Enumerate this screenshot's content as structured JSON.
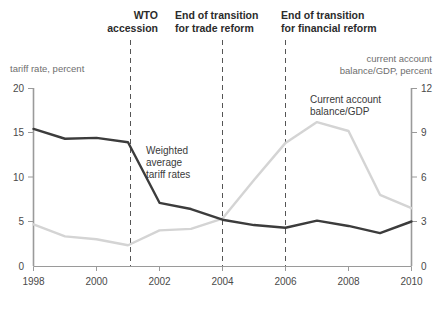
{
  "chart_data": {
    "type": "line",
    "title": "",
    "xlabel": "",
    "x": [
      1998,
      1999,
      2000,
      2001,
      2002,
      2003,
      2004,
      2005,
      2006,
      2007,
      2008,
      2009,
      2010
    ],
    "xtick_labels": [
      "1998",
      "2000",
      "2002",
      "2004",
      "2006",
      "2008",
      "2010"
    ],
    "xtick_values": [
      1998,
      2000,
      2002,
      2004,
      2006,
      2008,
      2010
    ],
    "xlim": [
      1998,
      2010
    ],
    "grid": false,
    "legend_position": "inline-annotations",
    "axes": [
      {
        "id": "left",
        "name": "tariff rate, percent",
        "ylim": [
          0,
          20
        ],
        "ticks": [
          0,
          5,
          10,
          15,
          20
        ],
        "tick_labels": [
          "0",
          "5",
          "10",
          "15",
          "20"
        ]
      },
      {
        "id": "right",
        "name": "current account balance/GDP, percent",
        "ylim": [
          0,
          12
        ],
        "ticks": [
          0,
          3,
          6,
          9,
          12
        ],
        "tick_labels": [
          "0",
          "3",
          "6",
          "9",
          "12"
        ]
      }
    ],
    "series": [
      {
        "name": "Weighted average tariff rates",
        "label": "Weighted\naverage\ntariff rates",
        "axis": "left",
        "color": "#3c3c3c",
        "values": [
          15.4,
          14.3,
          14.4,
          13.9,
          7.1,
          6.4,
          5.2,
          4.6,
          4.3,
          5.1,
          4.5,
          3.7,
          5.0
        ]
      },
      {
        "name": "Current account balance/GDP",
        "label": "Current account\nbalance/GDP",
        "axis": "right",
        "color": "#d4d4d4",
        "values": [
          2.8,
          2.0,
          1.8,
          1.4,
          2.4,
          2.5,
          3.2,
          5.8,
          8.3,
          9.7,
          9.1,
          4.8,
          3.9
        ]
      }
    ],
    "annotations": [
      {
        "id": "wto",
        "label": "WTO\naccession",
        "line1": "WTO",
        "line2": "accession",
        "x": 2001
      },
      {
        "id": "trade-reform",
        "label": "End of transition\nfor trade reform",
        "line1": "End of transition",
        "line2": "for trade reform",
        "x": 2004
      },
      {
        "id": "financial-reform",
        "label": "End of transition\nfor financial reform",
        "line1": "End of transition",
        "line2": "for financial reform",
        "x": 2006
      }
    ],
    "axis_unit_labels": {
      "left_line1": "tariff rate, percent",
      "right_line1": "current account",
      "right_line2": "balance/GDP, percent"
    },
    "series_inline_labels": {
      "tariff_line1": "Weighted",
      "tariff_line2": "average",
      "tariff_line3": "tariff rates",
      "ca_line1": "Current account",
      "ca_line2": "balance/GDP"
    },
    "colors": {
      "tariff_line": "#3c3c3c",
      "current_account_line": "#d4d4d4",
      "axis": "#9a9a9a",
      "annotation_line": "#555555",
      "text": "#3a3a3a"
    }
  }
}
